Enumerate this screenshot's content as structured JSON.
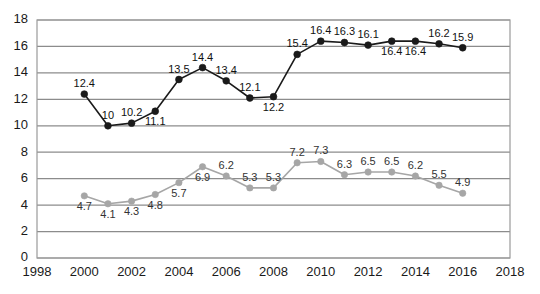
{
  "chart_data": {
    "type": "line",
    "title": "",
    "subtitle": "",
    "xlabel": "",
    "ylabel": "",
    "xlim": [
      1998,
      2018
    ],
    "ylim": [
      0,
      18
    ],
    "ytick_step": 2,
    "xtick_step": 2,
    "grid": true,
    "legend_position": "none",
    "xticks": [
      "1998",
      "2000",
      "2002",
      "2004",
      "2006",
      "2008",
      "2010",
      "2012",
      "2014",
      "2016",
      "2018"
    ],
    "yticks": [
      "0",
      "2",
      "4",
      "6",
      "8",
      "10",
      "12",
      "14",
      "16",
      "18"
    ],
    "x": [
      2000,
      2001,
      2002,
      2003,
      2004,
      2005,
      2006,
      2007,
      2008,
      2009,
      2010,
      2011,
      2012,
      2013,
      2014,
      2015,
      2016
    ],
    "series": [
      {
        "name": "dark-series",
        "color": "#1a1a1a",
        "marker": "circle",
        "values": [
          12.4,
          10,
          10.2,
          11.1,
          13.5,
          14.4,
          13.4,
          12.1,
          12.2,
          15.4,
          16.4,
          16.3,
          16.1,
          16.4,
          16.4,
          16.2,
          15.9
        ],
        "labels": [
          "12.4",
          "10",
          "10.2",
          "11.1",
          "13.5",
          "14.4",
          "13.4",
          "12.1",
          "12.2",
          "15.4",
          "16.4",
          "16.3",
          "16.1",
          "16.4",
          "16.4",
          "16.2",
          "15.9"
        ],
        "label_placement": [
          "above",
          "above",
          "above",
          "below",
          "above",
          "above",
          "above",
          "above",
          "below",
          "above",
          "above",
          "above",
          "above",
          "below",
          "below",
          "above",
          "above"
        ]
      },
      {
        "name": "gray-series",
        "color": "#a6a6a6",
        "marker": "circle",
        "values": [
          4.7,
          4.1,
          4.3,
          4.8,
          5.7,
          6.9,
          6.2,
          5.3,
          5.3,
          7.2,
          7.3,
          6.3,
          6.5,
          6.5,
          6.2,
          5.5,
          4.9
        ],
        "labels": [
          "4.7",
          "4.1",
          "4.3",
          "4.8",
          "5.7",
          "6.9",
          "6.2",
          "5.3",
          "5.3",
          "7.2",
          "7.3",
          "6.3",
          "6.5",
          "6.5",
          "6.2",
          "5.5",
          "4.9"
        ],
        "label_placement": [
          "below",
          "below",
          "below",
          "below",
          "below",
          "below",
          "above",
          "above",
          "above",
          "above",
          "above",
          "above",
          "above",
          "above",
          "above",
          "above",
          "above"
        ]
      }
    ]
  },
  "style": {
    "plot_border_color": "#9a9a9a",
    "gridline_color": "#8c8c8c",
    "axis_text_color": "#1a1a1a",
    "background": "#ffffff"
  }
}
